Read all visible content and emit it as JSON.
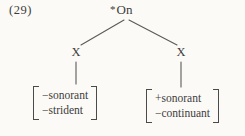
{
  "example_number": "(29)",
  "tree": {
    "root": {
      "star": "*",
      "label": "On"
    },
    "left": {
      "label": "X",
      "features": [
        "−sonorant",
        "−strident"
      ]
    },
    "right": {
      "label": "X",
      "features": [
        "+sonorant",
        "−continuant"
      ]
    }
  },
  "colors": {
    "background": "#fbfaf6",
    "text": "#3d3d3d",
    "line": "#5a5a5a"
  }
}
